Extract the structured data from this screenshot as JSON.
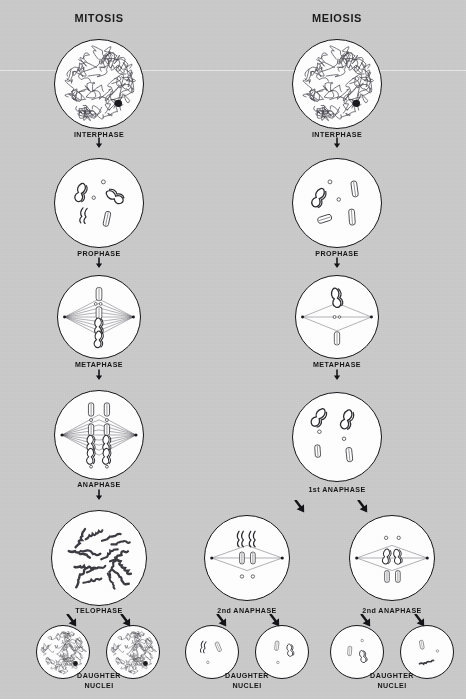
{
  "figure": {
    "background_color": "#c8c8c8",
    "ink_color": "#15151a",
    "cell_fill": "#fdfdfd"
  },
  "columns": [
    {
      "id": "mitosis",
      "title": "MITOSIS",
      "x": 99
    },
    {
      "id": "meiosis",
      "title": "MEIOSIS",
      "x": 337
    }
  ],
  "stages": {
    "mitosis": [
      {
        "key": "m-interphase",
        "label": "INTERPHASE",
        "cx": 99,
        "cy": 84,
        "r": 45,
        "kind": "chromatin-network",
        "label_y": 131
      },
      {
        "key": "m-prophase",
        "label": "PROPHASE",
        "cx": 99,
        "cy": 203,
        "r": 45,
        "kind": "prophase-scattered",
        "label_y": 250
      },
      {
        "key": "m-metaphase",
        "label": "METAPHASE",
        "cx": 99,
        "cy": 317,
        "r": 42,
        "kind": "metaphase-spindle-full",
        "label_y": 361
      },
      {
        "key": "m-anaphase",
        "label": "ANAPHASE",
        "cx": 99,
        "cy": 435,
        "r": 45,
        "kind": "anaphase-two-columns",
        "label_y": 481
      },
      {
        "key": "m-telophase",
        "label": "TELOPHASE",
        "cx": 99,
        "cy": 558,
        "r": 48,
        "kind": "telophase-loose",
        "label_y": 607
      },
      {
        "key": "m-daughter-left",
        "label": "",
        "cx": 63,
        "cy": 652,
        "r": 27,
        "kind": "chromatin-network-small",
        "label_y": 0
      },
      {
        "key": "m-daughter-right",
        "label": "",
        "cx": 133,
        "cy": 652,
        "r": 27,
        "kind": "chromatin-network-small",
        "label_y": 0
      }
    ],
    "meiosis": [
      {
        "key": "me-interphase",
        "label": "INTERPHASE",
        "cx": 337,
        "cy": 84,
        "r": 45,
        "kind": "chromatin-network",
        "label_y": 131
      },
      {
        "key": "me-prophase",
        "label": "PROPHASE",
        "cx": 337,
        "cy": 203,
        "r": 45,
        "kind": "prophase-paired",
        "label_y": 250
      },
      {
        "key": "me-metaphase",
        "label": "METAPHASE",
        "cx": 337,
        "cy": 317,
        "r": 42,
        "kind": "metaphase-spindle-sparse",
        "label_y": 361
      },
      {
        "key": "me-anaphase1",
        "label": "1st ANAPHASE",
        "cx": 337,
        "cy": 437,
        "r": 45,
        "kind": "anaphase1-scattered",
        "label_y": 486
      },
      {
        "key": "me-anaphase2-left",
        "label": "2nd ANAPHASE",
        "cx": 247,
        "cy": 558,
        "r": 43,
        "kind": "anaphase2-spindle",
        "label_y": 607
      },
      {
        "key": "me-anaphase2-right",
        "label": "2nd ANAPHASE",
        "cx": 392,
        "cy": 558,
        "r": 43,
        "kind": "anaphase2-spindle-b",
        "label_y": 607
      },
      {
        "key": "me-daughter-1",
        "label": "",
        "cx": 212,
        "cy": 652,
        "r": 27,
        "kind": "daughter-few-a",
        "label_y": 0
      },
      {
        "key": "me-daughter-2",
        "label": "",
        "cx": 282,
        "cy": 652,
        "r": 27,
        "kind": "daughter-few-b",
        "label_y": 0
      },
      {
        "key": "me-daughter-3",
        "label": "",
        "cx": 357,
        "cy": 652,
        "r": 27,
        "kind": "daughter-few-c",
        "label_y": 0
      },
      {
        "key": "me-daughter-4",
        "label": "",
        "cx": 427,
        "cy": 652,
        "r": 27,
        "kind": "daughter-few-d",
        "label_y": 0
      }
    ]
  },
  "daughter_labels": [
    {
      "key": "dn-mitosis",
      "line1": "DAUGHTER",
      "line2": "NUCLEI",
      "x": 99,
      "y": 672
    },
    {
      "key": "dn-meiosis-left",
      "line1": "DAUGHTER",
      "line2": "NUCLEI",
      "x": 247,
      "y": 672
    },
    {
      "key": "dn-meiosis-right",
      "line1": "DAUGHTER",
      "line2": "NUCLEI",
      "x": 392,
      "y": 672
    }
  ],
  "arrows": [
    {
      "key": "arrow-m-1",
      "x": 99,
      "y": 136,
      "dir": "down"
    },
    {
      "key": "arrow-m-2",
      "x": 99,
      "y": 256,
      "dir": "down"
    },
    {
      "key": "arrow-m-3",
      "x": 99,
      "y": 368,
      "dir": "down"
    },
    {
      "key": "arrow-m-4",
      "x": 99,
      "y": 488,
      "dir": "down"
    },
    {
      "key": "arrow-m-5",
      "x": 72,
      "y": 614,
      "dir": "down-left"
    },
    {
      "key": "arrow-m-6",
      "x": 126,
      "y": 614,
      "dir": "down-left"
    },
    {
      "key": "arrow-me-1",
      "x": 337,
      "y": 136,
      "dir": "down"
    },
    {
      "key": "arrow-me-2",
      "x": 337,
      "y": 256,
      "dir": "down"
    },
    {
      "key": "arrow-me-3",
      "x": 337,
      "y": 368,
      "dir": "down"
    },
    {
      "key": "arrow-me-4",
      "x": 300,
      "y": 500,
      "dir": "down-left"
    },
    {
      "key": "arrow-me-5",
      "x": 363,
      "y": 500,
      "dir": "down-left"
    },
    {
      "key": "arrow-me-6",
      "x": 222,
      "y": 614,
      "dir": "down-left"
    },
    {
      "key": "arrow-me-7",
      "x": 275,
      "y": 614,
      "dir": "down-left"
    },
    {
      "key": "arrow-me-8",
      "x": 366,
      "y": 614,
      "dir": "down-left"
    },
    {
      "key": "arrow-me-9",
      "x": 420,
      "y": 614,
      "dir": "down-left"
    }
  ]
}
